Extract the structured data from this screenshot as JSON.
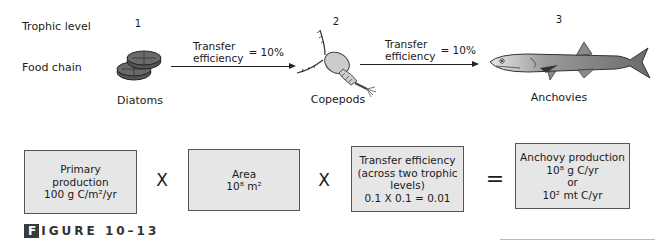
{
  "row_labels": {
    "trophic_level": "Trophic level",
    "food_chain": "Food chain"
  },
  "organisms": [
    {
      "level": "1",
      "name": "Diatoms",
      "icon": "diatoms-icon"
    },
    {
      "level": "2",
      "name": "Copepods",
      "icon": "copepod-icon"
    },
    {
      "level": "3",
      "name": "Anchovies",
      "icon": "anchovy-icon"
    }
  ],
  "transfers": [
    {
      "line1": "Transfer",
      "line2": "efficiency",
      "value": "= 10%"
    },
    {
      "line1": "Transfer",
      "line2": "efficiency",
      "value": "= 10%"
    }
  ],
  "equation": {
    "boxes": [
      {
        "lines": [
          "Primary",
          "production",
          "100 g C/m²/yr"
        ]
      },
      {
        "lines": [
          "Area",
          "10⁸ m²"
        ]
      },
      {
        "lines": [
          "Transfer efficiency",
          "(across two trophic",
          "levels)",
          "0.1 X 0.1 = 0.01"
        ]
      },
      {
        "lines": [
          "Anchovy production",
          "10⁸ g C/yr",
          "or",
          "10² mt C/yr"
        ]
      }
    ],
    "operators": [
      "X",
      "X",
      "="
    ]
  },
  "figure_label": {
    "first_letter": "F",
    "rest": "IGURE 10–13"
  },
  "colors": {
    "box_fill": "#e6e6e6",
    "box_border": "#555555",
    "fig_tab": "#3a3a3a"
  }
}
